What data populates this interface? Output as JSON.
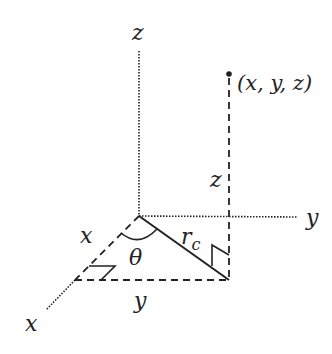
{
  "diagram": {
    "type": "3d-coordinate-cylindrical",
    "axes": {
      "z_label": "z",
      "y_label": "y",
      "x_label": "x"
    },
    "point": {
      "label": "(x, y, z)"
    },
    "segment_labels": {
      "height": "z",
      "x_component": "x",
      "y_component": "y",
      "radius": "r",
      "radius_subscript": "c",
      "angle": "θ"
    },
    "colors": {
      "line": "#222222",
      "background": "#ffffff"
    }
  }
}
